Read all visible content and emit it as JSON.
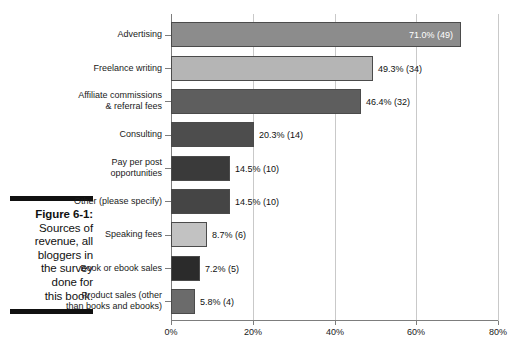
{
  "caption": {
    "figure_number": "Figure 6-1:",
    "lines": [
      "Sources of",
      "revenue, all",
      "bloggers in",
      "the survey",
      "done for",
      "this book."
    ]
  },
  "chart_data": {
    "type": "bar",
    "orientation": "horizontal",
    "title": "",
    "subtitle": "",
    "xlabel": "",
    "ylabel": "",
    "xlim": [
      0,
      80
    ],
    "grid": true,
    "legend": "none",
    "x_ticks": [
      "0%",
      "20%",
      "40%",
      "60%",
      "80%"
    ],
    "x_tick_values": [
      0,
      20,
      40,
      60,
      80
    ],
    "categories": [
      "Advertising",
      "Freelance writing",
      "Affiliate commissions & referral fees",
      "Consulting",
      "Pay per post opportunities",
      "Other (please specify)",
      "Speaking fees",
      "Book or ebook sales",
      "Product sales (other than books and ebooks)"
    ],
    "values": [
      71.0,
      49.3,
      46.4,
      20.3,
      14.5,
      14.5,
      8.7,
      7.2,
      5.8
    ],
    "counts": [
      49,
      34,
      32,
      14,
      10,
      10,
      6,
      5,
      4
    ],
    "data_labels": [
      "71.0% (49)",
      "49.3% (34)",
      "46.4% (32)",
      "20.3% (14)",
      "14.5% (10)",
      "14.5% (10)",
      "8.7% (6)",
      "7.2% (5)",
      "5.8% (4)"
    ],
    "bar_colors": [
      "#8c8c8c",
      "#b5b5b5",
      "#5e5e5e",
      "#4d4d4d",
      "#3a3a3a",
      "#454545",
      "#c2c2c2",
      "#2b2b2b",
      "#6b6b6b"
    ],
    "bar_border_color": "#4b4b4b",
    "axis_color": "#7d7d7d",
    "grid_color": "#c9c9c9"
  },
  "category_label_lines": [
    [
      "Advertising"
    ],
    [
      "Freelance writing"
    ],
    [
      "Affiliate commissions",
      "& referral fees"
    ],
    [
      "Consulting"
    ],
    [
      "Pay per post",
      "opportunities"
    ],
    [
      "Other (please specify)"
    ],
    [
      "Speaking fees"
    ],
    [
      "Book or ebook sales"
    ],
    [
      "Product sales (other",
      "than books and ebooks)"
    ]
  ]
}
